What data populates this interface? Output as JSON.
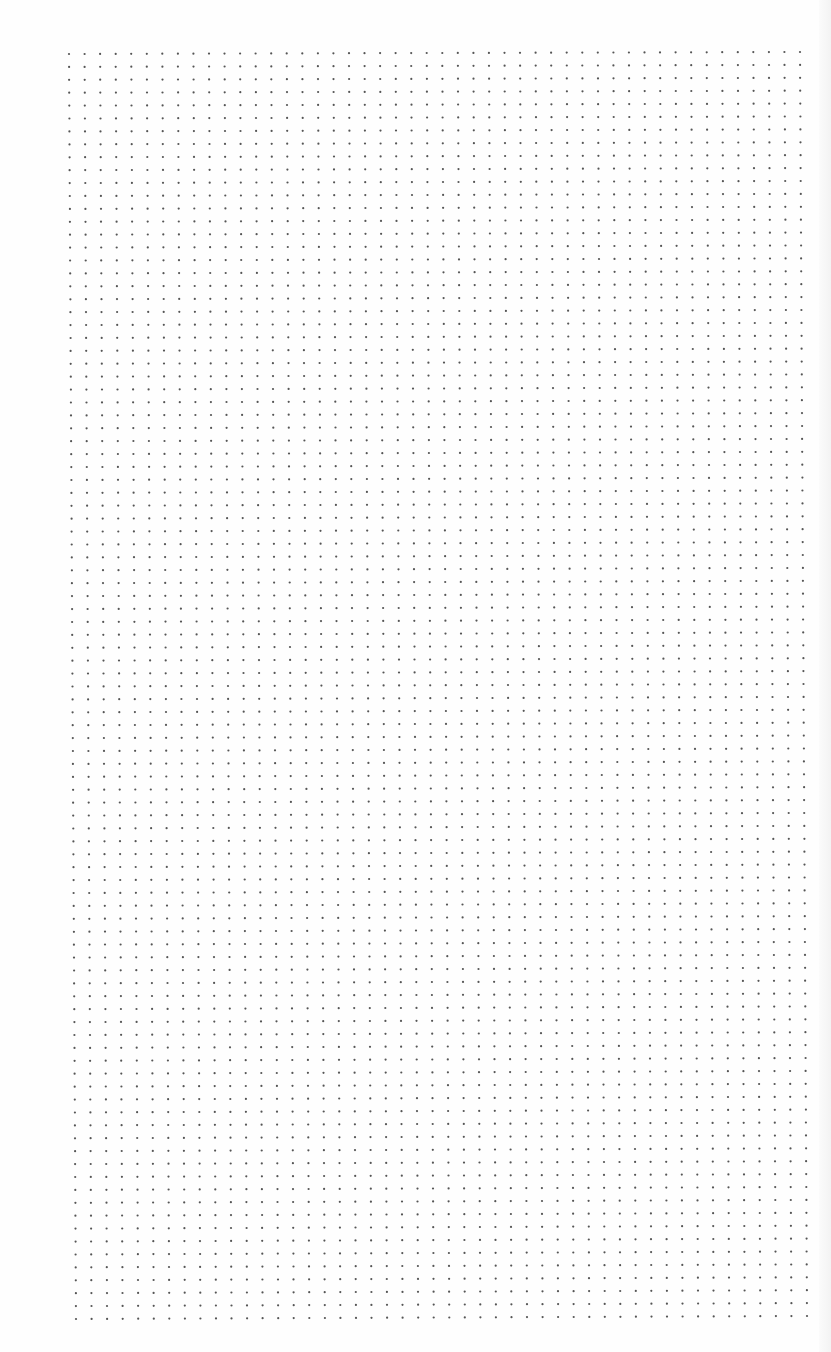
{
  "page": {
    "type": "dot-grid-paper",
    "background_color": "#fefefe",
    "dot_color": "#555555"
  },
  "grid": {
    "columns": 48,
    "rows": 99,
    "top_left": [
      69,
      54
    ],
    "top_right": [
      800,
      52
    ],
    "bottom_left": [
      76,
      1319
    ],
    "bottom_right": [
      807,
      1316
    ],
    "dot_radius": 1.1
  }
}
